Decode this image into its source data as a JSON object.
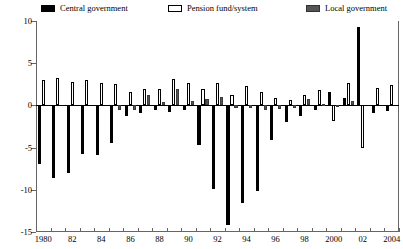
{
  "legend": {
    "items": [
      {
        "label": "Central government",
        "key": "central",
        "color": "#000000"
      },
      {
        "label": "Pension fund/system",
        "key": "pension",
        "color": "#ffffff"
      },
      {
        "label": "Local government",
        "key": "local",
        "color": "#555555"
      }
    ]
  },
  "axes": {
    "y_ticks": [
      10,
      5,
      0,
      -5,
      -10,
      -15
    ],
    "y_tick_labels": [
      "10",
      "5",
      "0",
      "-5",
      "-10",
      "-15"
    ],
    "x_tick_labels": [
      "1980",
      "82",
      "84",
      "86",
      "88",
      "90",
      "92",
      "94",
      "96",
      "98",
      "2000",
      "02",
      "2004"
    ]
  },
  "chart_data": {
    "type": "bar",
    "title": "",
    "subtitle": "",
    "xlabel": "",
    "ylabel": "",
    "ylim": [
      -15,
      10
    ],
    "grid": false,
    "legend_position": "top",
    "categories": [
      "1980",
      "1981",
      "1982",
      "1983",
      "1984",
      "1985",
      "1986",
      "1987",
      "1988",
      "1989",
      "1990",
      "1991",
      "1992",
      "1993",
      "1994",
      "1995",
      "1996",
      "1997",
      "1998",
      "1999",
      "2000",
      "2001",
      "2002",
      "2003",
      "2004"
    ],
    "series": [
      {
        "name": "Central government",
        "color": "#000000",
        "values": [
          -6.9,
          -8.6,
          -8.0,
          -5.8,
          -5.9,
          -4.4,
          -1.2,
          -0.9,
          -0.6,
          -0.8,
          -0.5,
          -4.7,
          -9.9,
          -14.2,
          -11.6,
          -10.2,
          -4.1,
          -2.0,
          -1.2,
          -0.6,
          1.6,
          0.9,
          9.3,
          -0.9,
          -0.7
        ]
      },
      {
        "name": "Pension fund/system",
        "color": "#ffffff",
        "values": [
          3.0,
          3.2,
          2.8,
          3.0,
          2.6,
          2.5,
          1.6,
          1.9,
          2.0,
          3.1,
          2.7,
          1.9,
          2.6,
          1.2,
          2.3,
          1.6,
          0.9,
          0.6,
          1.2,
          1.8,
          -1.9,
          2.6,
          -5.0,
          2.1,
          2.4
        ]
      },
      {
        "name": "Local government",
        "color": "#555555",
        "values": [
          0.0,
          0.0,
          0.0,
          0.0,
          0.0,
          -0.6,
          -0.5,
          1.2,
          0.4,
          1.9,
          0.5,
          0.8,
          1.0,
          -0.3,
          -0.3,
          -0.6,
          -0.4,
          -0.3,
          0.7,
          0.2,
          -0.2,
          0.5,
          0.0,
          0.0,
          0.0
        ]
      }
    ]
  }
}
